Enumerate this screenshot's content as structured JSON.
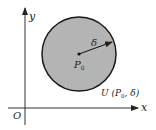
{
  "diagram": {
    "axes": {
      "x_label": "x",
      "y_label": "y",
      "origin_label": "O"
    },
    "disk": {
      "fill": "#b4b4b4",
      "stroke": "#1a1a1a",
      "center_label_main": "P",
      "center_label_sub": "0",
      "radius_label": "δ",
      "region_label_prefix": "U (P",
      "region_label_sub": "0",
      "region_label_suffix": ", δ)"
    }
  }
}
